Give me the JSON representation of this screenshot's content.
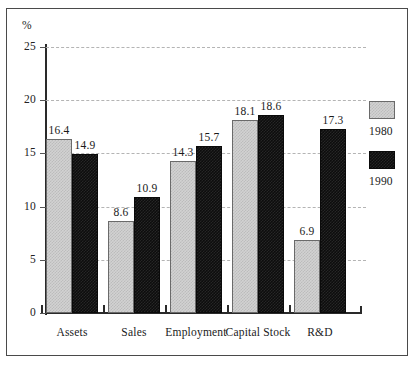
{
  "chart_data": {
    "type": "bar",
    "title": "",
    "subtitle": "",
    "xlabel": "",
    "ylabel": "%",
    "ylim": [
      0,
      25
    ],
    "ytick_values": [
      0,
      5,
      10,
      15,
      20,
      25
    ],
    "ytick_labels": [
      "0",
      "5",
      "10",
      "15",
      "20",
      "25"
    ],
    "grid": "horizontal-dashed",
    "legend_position": "right",
    "categories": [
      "Assets",
      "Sales",
      "Employment",
      "Capital Stock",
      "R&D"
    ],
    "series": [
      {
        "name": "1980",
        "color": "#d2d2d2",
        "pattern": "light-gray-checkered",
        "values": [
          16.4,
          8.6,
          14.3,
          18.1,
          6.9
        ],
        "labels": [
          "16.4",
          "8.6",
          "14.3",
          "18.1",
          "6.9"
        ]
      },
      {
        "name": "1990",
        "color": "#0d0d0d",
        "pattern": "solid-black",
        "values": [
          14.9,
          10.9,
          15.7,
          18.6,
          17.3
        ],
        "labels": [
          "14.9",
          "10.9",
          "15.7",
          "18.6",
          "17.3"
        ]
      }
    ]
  },
  "legend": {
    "entries": [
      {
        "label": "1980",
        "swatch": "legend-swatch-1980"
      },
      {
        "label": "1990",
        "swatch": "legend-swatch-1990"
      }
    ]
  },
  "axis": {
    "unit_label": "%"
  }
}
